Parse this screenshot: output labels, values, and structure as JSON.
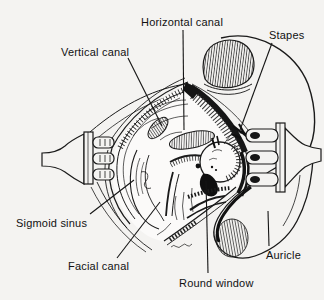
{
  "figure": {
    "background_color": "#f4f3f1",
    "ink_color": "#1a1a1a",
    "labels": {
      "horizontal_canal": "Horizontal canal",
      "stapes": "Stapes",
      "vertical_canal": "Vertical canal",
      "sigmoid_sinus": "Sigmoid sinus",
      "facial_canal": "Facial canal",
      "round_window": "Round window",
      "auricle": "Auricle"
    }
  }
}
